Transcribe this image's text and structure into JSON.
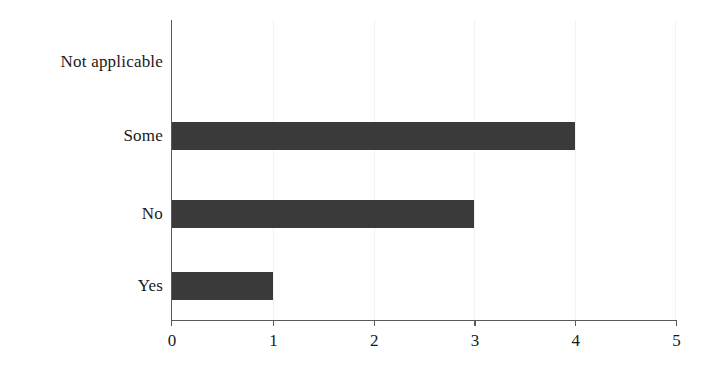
{
  "chart_data": {
    "type": "bar",
    "orientation": "horizontal",
    "title": "",
    "subtitle": "",
    "xlabel": "",
    "ylabel": "",
    "categories": [
      "Not applicable",
      "Some",
      "No",
      "Yes"
    ],
    "values": [
      0,
      4,
      3,
      1
    ],
    "series": [
      {
        "name": "Count",
        "values": [
          0,
          4,
          3,
          1
        ]
      }
    ],
    "xlim": [
      0,
      5
    ],
    "x_ticks": [
      0,
      1,
      2,
      3,
      4,
      5
    ],
    "x_tick_labels": [
      "0",
      "1",
      "2",
      "3",
      "4",
      "5"
    ],
    "grid": true,
    "grid_axis": "x",
    "legend": false,
    "legend_position": "none",
    "annotations": [],
    "colors": {
      "bar": "#3a3a3a",
      "axis": "#5a5a5a",
      "grid": "#f2f2f2",
      "text": "#1a1a1a",
      "background": "#ffffff"
    }
  }
}
